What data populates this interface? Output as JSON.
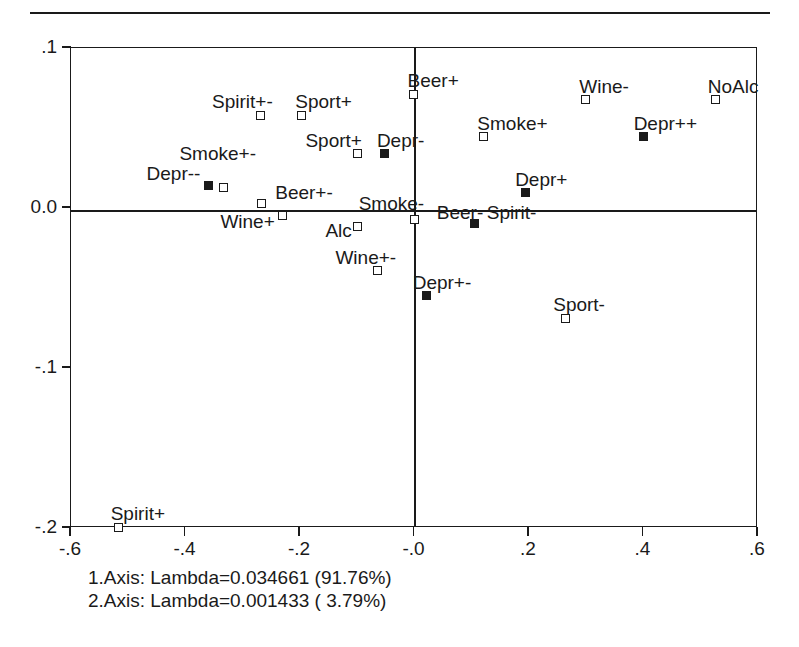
{
  "chart_data": {
    "type": "scatter",
    "title": "",
    "xlabel": "",
    "ylabel": "",
    "xlim": [
      -0.6,
      0.6
    ],
    "ylim": [
      -0.2,
      0.1
    ],
    "grid": false,
    "legend": null,
    "xticks": [
      "-.6",
      "-.4",
      "-.2",
      "-.0",
      ".2",
      ".4",
      ".6"
    ],
    "xtickvalues": [
      -0.6,
      -0.4,
      -0.2,
      0.0,
      0.2,
      0.4,
      0.6
    ],
    "yticks": [
      ".1",
      "0.0",
      "-.1",
      "-.2"
    ],
    "ytickvalues": [
      0.1,
      0.0,
      -0.1,
      -0.2
    ],
    "marker_styles": {
      "open": "open-square",
      "filled": "filled-square"
    },
    "points": [
      {
        "label": "Beer+",
        "x": 0.0,
        "y": 0.0705,
        "marker": "open",
        "label_dx": -6,
        "label_dy": -24
      },
      {
        "label": "Wine-",
        "x": 0.3,
        "y": 0.067,
        "marker": "open",
        "label_dx": -6,
        "label_dy": -24
      },
      {
        "label": "NoAlc",
        "x": 0.528,
        "y": 0.067,
        "marker": "open",
        "label_dx": -8,
        "label_dy": -24
      },
      {
        "label": "Spirit+-",
        "x": -0.268,
        "y": 0.0575,
        "marker": "open",
        "label_dx": -48,
        "label_dy": -24
      },
      {
        "label": "Sport+",
        "x": -0.196,
        "y": 0.0575,
        "marker": "open",
        "label_dx": -6,
        "label_dy": -24
      },
      {
        "label": "Smoke+",
        "x": 0.122,
        "y": 0.0438,
        "marker": "open",
        "label_dx": -6,
        "label_dy": -24
      },
      {
        "label": "Depr++",
        "x": 0.402,
        "y": 0.0438,
        "marker": "filled",
        "label_dx": -10,
        "label_dy": -24
      },
      {
        "label": "Sport+",
        "x": -0.098,
        "y": 0.0332,
        "marker": "open",
        "label_dx": -52,
        "label_dy": -24
      },
      {
        "label": "Depr-",
        "x": -0.05,
        "y": 0.0332,
        "marker": "filled",
        "label_dx": -8,
        "label_dy": -24
      },
      {
        "label": "Depr--",
        "x": -0.358,
        "y": 0.0132,
        "marker": "filled",
        "label_dx": -62,
        "label_dy": -23
      },
      {
        "label": "Smoke+-",
        "x": -0.332,
        "y": 0.0125,
        "marker": "open",
        "label_dx": -44,
        "label_dy": -44
      },
      {
        "label": "Depr+",
        "x": 0.195,
        "y": 0.009,
        "marker": "filled",
        "label_dx": -10,
        "label_dy": -24
      },
      {
        "label": "Beer+-",
        "x": -0.266,
        "y": 0.002,
        "marker": "open",
        "label_dx": 14,
        "label_dy": -22
      },
      {
        "label": "Smoke-",
        "x": 0.002,
        "y": -0.0078,
        "marker": "open",
        "label_dx": -56,
        "label_dy": -26
      },
      {
        "label": "Wine+",
        "x": -0.229,
        "y": -0.005,
        "marker": "open",
        "label_dx": -62,
        "label_dy": -4
      },
      {
        "label": "Alc",
        "x": -0.098,
        "y": -0.012,
        "marker": "open",
        "label_dx": -32,
        "label_dy": -6
      },
      {
        "label": "Beer-",
        "x": 0.107,
        "y": -0.0105,
        "marker": "filled",
        "label_dx": -38,
        "label_dy": -22
      },
      {
        "label": "Spirit-",
        "x": 0.107,
        "y": -0.0105,
        "marker": "filled",
        "label_dx": 12,
        "label_dy": -22
      },
      {
        "label": "Wine+-",
        "x": -0.063,
        "y": -0.0395,
        "marker": "open",
        "label_dx": -42,
        "label_dy": -23
      },
      {
        "label": "Depr+-",
        "x": 0.023,
        "y": -0.0555,
        "marker": "filled",
        "label_dx": -14,
        "label_dy": -24
      },
      {
        "label": "Sport-",
        "x": 0.265,
        "y": -0.0695,
        "marker": "open",
        "label_dx": -12,
        "label_dy": -24
      },
      {
        "label": "Spirit+",
        "x": -0.515,
        "y": -0.2,
        "marker": "open",
        "label_dx": -8,
        "label_dy": -24
      }
    ],
    "annotations": [
      "1.Axis: Lambda=0.034661 (91.76%)",
      "2.Axis: Lambda=0.001433 ( 3.79%)"
    ]
  },
  "geometry": {
    "plot_left": 70,
    "plot_top": 47,
    "plot_width": 687,
    "plot_height": 480
  }
}
